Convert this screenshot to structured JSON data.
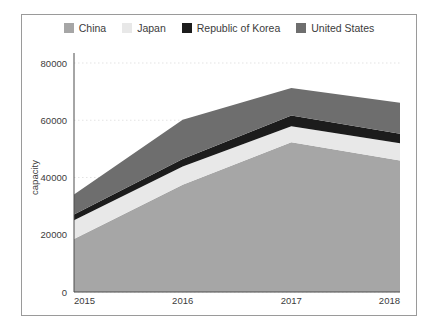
{
  "chart_data": {
    "type": "area",
    "stacked": true,
    "title": "",
    "xlabel": "",
    "ylabel": "capacity",
    "x": [
      "2015",
      "2016",
      "2017",
      "2018"
    ],
    "categories": [
      "2015",
      "2016",
      "2017",
      "2018"
    ],
    "xtick_labels": [
      "2015",
      "2016",
      "2017",
      "2018"
    ],
    "ytick_labels": [
      "0",
      "20000",
      "40000",
      "60000",
      "80000"
    ],
    "yticks": [
      0,
      20000,
      40000,
      60000,
      80000
    ],
    "ylim": [
      0,
      80000
    ],
    "grid": true,
    "grid_axis": "y",
    "legend_position": "top-center",
    "series": [
      {
        "name": "China",
        "color": "#a6a6a6",
        "values": [
          18500,
          37500,
          52300,
          45900
        ],
        "cumulative": [
          18500,
          37500,
          52300,
          45900
        ]
      },
      {
        "name": "Japan",
        "color": "#e8e8e8",
        "values": [
          6600,
          6300,
          5600,
          6100
        ],
        "cumulative": [
          25100,
          43800,
          57900,
          52000
        ]
      },
      {
        "name": "Republic of Korea",
        "color": "#1c1c1c",
        "values": [
          2000,
          2700,
          3800,
          3250
        ],
        "cumulative": [
          27100,
          46500,
          61700,
          55250
        ]
      },
      {
        "name": "United States",
        "color": "#6e6e6e",
        "values": [
          7000,
          13700,
          9550,
          10900
        ],
        "cumulative": [
          34100,
          60200,
          71250,
          66150
        ]
      }
    ]
  },
  "legend": {
    "entries": [
      {
        "label": "China"
      },
      {
        "label": "Japan"
      },
      {
        "label": "Republic of Korea"
      },
      {
        "label": "United States"
      }
    ]
  },
  "axes": {
    "y_title": "capacity"
  },
  "colors": {
    "china": "#a6a6a6",
    "japan": "#e8e8e8",
    "korea": "#1c1c1c",
    "united_states": "#6e6e6e",
    "grid": "#e3e3e3",
    "axis": "#4d4d4d",
    "text": "#3c3c3c",
    "border": "#9a9a9a",
    "background": "#ffffff"
  }
}
